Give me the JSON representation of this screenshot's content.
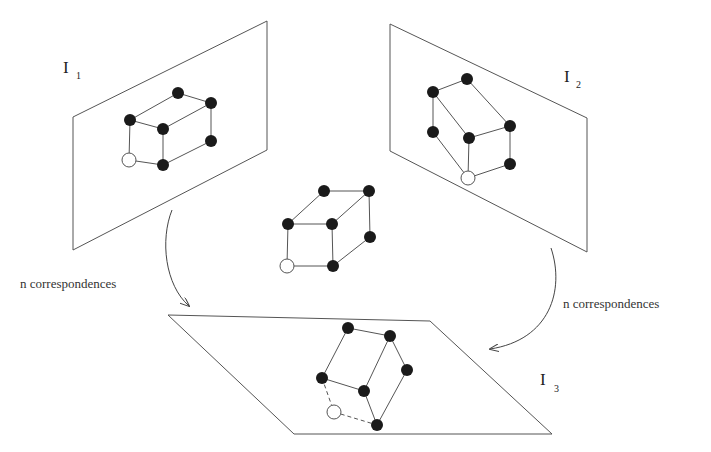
{
  "figure": {
    "planes": {
      "i1": {
        "label": "I",
        "subscript": "1"
      },
      "i2": {
        "label": "I",
        "subscript": "2"
      },
      "i3": {
        "label": "I",
        "subscript": "3"
      }
    },
    "arrows": {
      "left": {
        "label": "n correspondences"
      },
      "right": {
        "label": "n correspondences"
      }
    },
    "colors": {
      "line": "#555555",
      "point": "#1a1a1a",
      "background": "#ffffff"
    }
  }
}
